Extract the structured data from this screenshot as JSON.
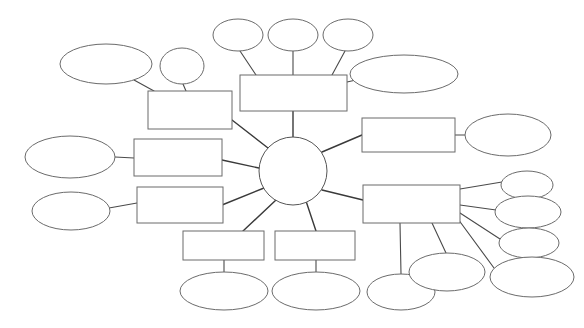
{
  "document": {
    "title": "Blank Mind Map",
    "description": "Empty concept map template with a central circle hub, radiating rectangle branches and blank oval sub-nodes",
    "canvas": {
      "width": 584,
      "height": 328,
      "background": "#ffffff"
    },
    "style": {
      "shape_fill": "#ffffff",
      "shape_stroke": "#6b6b6b",
      "connector_stroke": "#3a3a3a"
    }
  },
  "hub": {
    "name": "central-topic",
    "label": "",
    "cx": 293,
    "cy": 171,
    "r": 34
  },
  "boxes": [
    {
      "id": "box-top-center",
      "label": "",
      "x": 240,
      "y": 75,
      "w": 107,
      "h": 36
    },
    {
      "id": "box-upper-left",
      "label": "",
      "x": 148,
      "y": 91,
      "w": 84,
      "h": 38
    },
    {
      "id": "box-mid-left",
      "label": "",
      "x": 134,
      "y": 139,
      "w": 88,
      "h": 37
    },
    {
      "id": "box-lower-left",
      "label": "",
      "x": 137,
      "y": 187,
      "w": 86,
      "h": 36
    },
    {
      "id": "box-bottom-left-center",
      "label": "",
      "x": 183,
      "y": 231,
      "w": 81,
      "h": 29
    },
    {
      "id": "box-bottom-right-center",
      "label": "",
      "x": 275,
      "y": 231,
      "w": 80,
      "h": 29
    },
    {
      "id": "box-upper-right",
      "label": "",
      "x": 362,
      "y": 118,
      "w": 93,
      "h": 34
    },
    {
      "id": "box-lower-right",
      "label": "",
      "x": 363,
      "y": 185,
      "w": 97,
      "h": 38
    }
  ],
  "ovals": [
    {
      "id": "oval-top-left-large",
      "label": "",
      "cx": 106,
      "cy": 64,
      "rx": 46,
      "ry": 20
    },
    {
      "id": "oval-top-left-small",
      "label": "",
      "cx": 182,
      "cy": 66,
      "rx": 22,
      "ry": 18
    },
    {
      "id": "oval-top-1",
      "label": "",
      "cx": 238,
      "cy": 35,
      "rx": 25,
      "ry": 16
    },
    {
      "id": "oval-top-2",
      "label": "",
      "cx": 293,
      "cy": 35,
      "rx": 25,
      "ry": 16
    },
    {
      "id": "oval-top-3",
      "label": "",
      "cx": 348,
      "cy": 35,
      "rx": 25,
      "ry": 16
    },
    {
      "id": "oval-top-right-wide",
      "label": "",
      "cx": 404,
      "cy": 74,
      "rx": 54,
      "ry": 19
    },
    {
      "id": "oval-left-mid",
      "label": "",
      "cx": 70,
      "cy": 157,
      "rx": 45,
      "ry": 21
    },
    {
      "id": "oval-left-lower",
      "label": "",
      "cx": 71,
      "cy": 211,
      "rx": 39,
      "ry": 19
    },
    {
      "id": "oval-bottom-left-center",
      "label": "",
      "cx": 224,
      "cy": 291,
      "rx": 44,
      "ry": 19
    },
    {
      "id": "oval-bottom-right-center",
      "label": "",
      "cx": 316,
      "cy": 291,
      "rx": 44,
      "ry": 19
    },
    {
      "id": "oval-right-upper",
      "label": "",
      "cx": 508,
      "cy": 135,
      "rx": 43,
      "ry": 21
    },
    {
      "id": "oval-right-1",
      "label": "",
      "cx": 527,
      "cy": 185,
      "rx": 26,
      "ry": 14
    },
    {
      "id": "oval-right-2",
      "label": "",
      "cx": 528,
      "cy": 212,
      "rx": 33,
      "ry": 16
    },
    {
      "id": "oval-right-3",
      "label": "",
      "cx": 529,
      "cy": 243,
      "rx": 30,
      "ry": 15
    },
    {
      "id": "oval-right-4",
      "label": "",
      "cx": 532,
      "cy": 277,
      "rx": 42,
      "ry": 20
    },
    {
      "id": "oval-bottom-under-box",
      "label": "",
      "cx": 401,
      "cy": 292,
      "rx": 34,
      "ry": 18
    },
    {
      "id": "oval-bottom-mid-right",
      "label": "",
      "cx": 447,
      "cy": 272,
      "rx": 38,
      "ry": 19
    }
  ],
  "connectors": [
    {
      "id": "hub-to-box-top-center",
      "from": "central-topic",
      "to": "box-top-center",
      "x1": 293,
      "y1": 137,
      "x2": 293,
      "y2": 111
    },
    {
      "id": "hub-to-box-upper-left",
      "from": "central-topic",
      "to": "box-upper-left",
      "x1": 268,
      "y1": 148,
      "x2": 232,
      "y2": 120
    },
    {
      "id": "hub-to-box-mid-left",
      "from": "central-topic",
      "to": "box-mid-left",
      "x1": 259,
      "y1": 168,
      "x2": 222,
      "y2": 160
    },
    {
      "id": "hub-to-box-lower-left",
      "from": "central-topic",
      "to": "box-lower-left",
      "x1": 264,
      "y1": 188,
      "x2": 222,
      "y2": 205
    },
    {
      "id": "hub-to-box-bottom-left-center",
      "from": "central-topic",
      "to": "box-bottom-left-center",
      "x1": 276,
      "y1": 200,
      "x2": 243,
      "y2": 231
    },
    {
      "id": "hub-to-box-bottom-right-center",
      "from": "central-topic",
      "to": "box-bottom-right-center",
      "x1": 306,
      "y1": 201,
      "x2": 316,
      "y2": 231
    },
    {
      "id": "hub-to-box-upper-right",
      "from": "central-topic",
      "to": "box-upper-right",
      "x1": 322,
      "y1": 152,
      "x2": 362,
      "y2": 135
    },
    {
      "id": "hub-to-box-lower-right",
      "from": "central-topic",
      "to": "box-lower-right",
      "x1": 322,
      "y1": 190,
      "x2": 363,
      "y2": 200
    },
    {
      "id": "box-top-center-to-oval-top-1",
      "from": "box-top-center",
      "to": "oval-top-1",
      "x1": 256,
      "y1": 75,
      "x2": 240,
      "y2": 51
    },
    {
      "id": "box-top-center-to-oval-top-2",
      "from": "box-top-center",
      "to": "oval-top-2",
      "x1": 293,
      "y1": 75,
      "x2": 293,
      "y2": 51
    },
    {
      "id": "box-top-center-to-oval-top-3",
      "from": "box-top-center",
      "to": "oval-top-3",
      "x1": 332,
      "y1": 75,
      "x2": 345,
      "y2": 51
    },
    {
      "id": "box-top-center-to-oval-top-right-wide",
      "from": "box-top-center",
      "to": "oval-top-right-wide",
      "x1": 347,
      "y1": 82,
      "x2": 356,
      "y2": 80
    },
    {
      "id": "box-upper-left-to-oval-top-left-large",
      "from": "box-upper-left",
      "to": "oval-top-left-large",
      "x1": 154,
      "y1": 91,
      "x2": 134,
      "y2": 80
    },
    {
      "id": "box-upper-left-to-oval-top-left-small",
      "from": "box-upper-left",
      "to": "oval-top-left-small",
      "x1": 186,
      "y1": 91,
      "x2": 183,
      "y2": 84
    },
    {
      "id": "box-mid-left-to-oval-left-mid",
      "from": "box-mid-left",
      "to": "oval-left-mid",
      "x1": 134,
      "y1": 158,
      "x2": 115,
      "y2": 157
    },
    {
      "id": "box-lower-left-to-oval-left-lower",
      "from": "box-lower-left",
      "to": "oval-left-lower",
      "x1": 137,
      "y1": 203,
      "x2": 109,
      "y2": 208
    },
    {
      "id": "box-bottom-left-center-to-oval",
      "from": "box-bottom-left-center",
      "to": "oval-bottom-left-center",
      "x1": 224,
      "y1": 260,
      "x2": 224,
      "y2": 272
    },
    {
      "id": "box-bottom-right-center-to-oval",
      "from": "box-bottom-right-center",
      "to": "oval-bottom-right-center",
      "x1": 316,
      "y1": 260,
      "x2": 316,
      "y2": 272
    },
    {
      "id": "box-upper-right-to-oval-right-upper",
      "from": "box-upper-right",
      "to": "oval-right-upper",
      "x1": 455,
      "y1": 135,
      "x2": 465,
      "y2": 135
    },
    {
      "id": "box-lower-right-to-oval-right-1",
      "from": "box-lower-right",
      "to": "oval-right-1",
      "x1": 460,
      "y1": 189,
      "x2": 502,
      "y2": 182
    },
    {
      "id": "box-lower-right-to-oval-right-2",
      "from": "box-lower-right",
      "to": "oval-right-2",
      "x1": 460,
      "y1": 205,
      "x2": 496,
      "y2": 210
    },
    {
      "id": "box-lower-right-to-oval-right-3",
      "from": "box-lower-right",
      "to": "oval-right-3",
      "x1": 460,
      "y1": 213,
      "x2": 500,
      "y2": 239
    },
    {
      "id": "box-lower-right-to-oval-right-4",
      "from": "box-lower-right",
      "to": "oval-right-4",
      "x1": 458,
      "y1": 219,
      "x2": 494,
      "y2": 268
    },
    {
      "id": "box-lower-right-to-oval-bottom-under-box",
      "from": "box-lower-right",
      "to": "oval-bottom-under-box",
      "x1": 400,
      "y1": 223,
      "x2": 401,
      "y2": 274
    },
    {
      "id": "box-lower-right-to-oval-bottom-mid-right",
      "from": "box-lower-right",
      "to": "oval-bottom-mid-right",
      "x1": 432,
      "y1": 223,
      "x2": 446,
      "y2": 253
    }
  ]
}
